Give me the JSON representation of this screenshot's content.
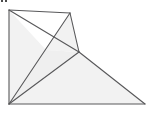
{
  "figure": {
    "canvas": {
      "width": 154,
      "height": 121
    },
    "background_color": "#ffffff",
    "fill_color": "#f2f2f2",
    "fill_color_alt": "#efefef",
    "stroke_color": "#58585a",
    "stroke_width": 1.1,
    "vertices": {
      "top_left": {
        "name": "A",
        "x": 9,
        "y": 10
      },
      "peak": {
        "name": "B",
        "x": 70,
        "y": 13
      },
      "junction": {
        "name": "C",
        "x": 79,
        "y": 52
      },
      "bottom_right": {
        "name": "D",
        "x": 145,
        "y": 104
      },
      "bottom_left": {
        "name": "E",
        "x": 9,
        "y": 104
      },
      "crossing": {
        "name": "X",
        "x": 46,
        "y": 50
      }
    },
    "outline_points": "9,10 70,13 79,52 145,104 9,104",
    "faces": [
      {
        "id": "face-left-wing",
        "label": "left wing region",
        "points": "9,10 46,50 9,104",
        "fill": "#f2f2f2"
      },
      {
        "id": "face-upper-spike",
        "label": "upper spike region",
        "points": "46,50 70,13 79,52",
        "fill": "#f2f2f2"
      },
      {
        "id": "face-middle-sliver",
        "label": "middle sliver region",
        "points": "9,104 46,50 79,52",
        "fill": "#efefef"
      },
      {
        "id": "face-lower-right",
        "label": "lower right region",
        "points": "9,104 79,52 145,104",
        "fill": "#f2f2f2"
      }
    ],
    "edges": [
      {
        "id": "edge-top-left-to-peak",
        "label": "A-B top edge",
        "d": "M 9,10 L 70,13"
      },
      {
        "id": "edge-peak-to-junction",
        "label": "B-C right upper edge",
        "d": "M 70,13 L 79,52"
      },
      {
        "id": "edge-junction-to-bottom-right",
        "label": "C-D right lower edge",
        "d": "M 79,52 L 145,104"
      },
      {
        "id": "edge-bottom",
        "label": "D-E bottom edge",
        "d": "M 145,104 L 9,104"
      },
      {
        "id": "edge-left",
        "label": "E-A left edge",
        "d": "M 9,104 L 9,10"
      },
      {
        "id": "diagonal-bottomleft-to-peak",
        "label": "E-B internal diagonal",
        "d": "M 9,104 L 70,13"
      },
      {
        "id": "diagonal-bottomleft-to-junction",
        "label": "E-C internal diagonal",
        "d": "M 9,104 L 79,52"
      },
      {
        "id": "diagonal-topleft-to-junction",
        "label": "A-C internal diagonal",
        "d": "M 9,10 L 79,52"
      }
    ],
    "corner_marks": [
      {
        "id": "corner-mark-1",
        "x": 1,
        "y": 0
      },
      {
        "id": "corner-mark-2",
        "x": 5,
        "y": 0
      }
    ]
  }
}
